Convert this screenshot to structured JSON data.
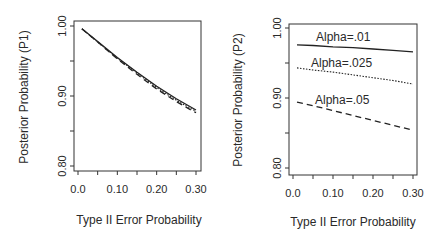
{
  "chart_data": [
    {
      "type": "line",
      "title": "",
      "xlabel": "Type II Error Probability",
      "ylabel": "Posterior Probability (P1)",
      "xlim": [
        0.0,
        0.3
      ],
      "ylim": [
        0.8,
        1.0
      ],
      "x_ticks": [
        0.0,
        0.05,
        0.1,
        0.15,
        0.2,
        0.25,
        0.3
      ],
      "x_tick_labels": [
        "0.0",
        "0.10",
        "0.20",
        "0.30"
      ],
      "y_ticks": [
        0.8,
        0.85,
        0.9,
        0.95,
        1.0
      ],
      "y_tick_labels": [
        "0.80",
        "0.90",
        "1.00"
      ],
      "grid": false,
      "x": [
        0.01,
        0.05,
        0.1,
        0.15,
        0.2,
        0.25,
        0.3
      ],
      "series": [
        {
          "name": "Alpha=.01",
          "style": "solid",
          "values": [
            0.996,
            0.978,
            0.955,
            0.934,
            0.914,
            0.896,
            0.88
          ]
        },
        {
          "name": "Alpha=.025",
          "style": "dotted",
          "values": [
            0.996,
            0.977,
            0.954,
            0.933,
            0.912,
            0.894,
            0.878
          ]
        },
        {
          "name": "Alpha=.05",
          "style": "dashed",
          "values": [
            0.996,
            0.977,
            0.953,
            0.931,
            0.91,
            0.892,
            0.876
          ]
        }
      ]
    },
    {
      "type": "line",
      "title": "",
      "xlabel": "Type II Error Probability",
      "ylabel": "Posterior Probability (P2)",
      "xlim": [
        0.0,
        0.3
      ],
      "ylim": [
        0.8,
        1.0
      ],
      "x_ticks": [
        0.0,
        0.05,
        0.1,
        0.15,
        0.2,
        0.25,
        0.3
      ],
      "x_tick_labels": [
        "0.0",
        "0.10",
        "0.20",
        "0.30"
      ],
      "y_ticks": [
        0.8,
        0.85,
        0.9,
        0.95,
        1.0
      ],
      "y_tick_labels": [
        "0.80",
        "0.90",
        "1.00"
      ],
      "grid": false,
      "annotations": [
        "Alpha=.01",
        "Alpha=.025",
        "Alpha=.05"
      ],
      "x": [
        0.01,
        0.05,
        0.1,
        0.15,
        0.2,
        0.25,
        0.3
      ],
      "series": [
        {
          "name": "Alpha=.01",
          "style": "solid",
          "values": [
            0.976,
            0.975,
            0.973,
            0.972,
            0.97,
            0.968,
            0.966
          ]
        },
        {
          "name": "Alpha=.025",
          "style": "dotted",
          "values": [
            0.943,
            0.94,
            0.937,
            0.933,
            0.929,
            0.925,
            0.92
          ]
        },
        {
          "name": "Alpha=.05",
          "style": "dashed",
          "values": [
            0.894,
            0.889,
            0.882,
            0.875,
            0.868,
            0.861,
            0.854
          ]
        }
      ]
    }
  ]
}
